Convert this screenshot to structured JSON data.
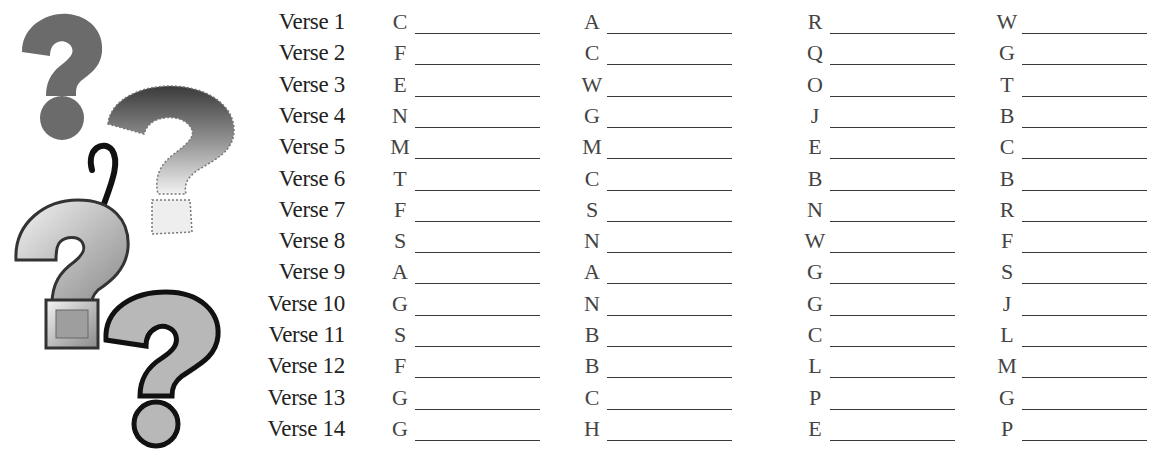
{
  "worksheet": {
    "decorations": [
      "question-mark-gray",
      "question-mark-fuzzy-gradient",
      "question-mark-script",
      "question-mark-beveled-3d",
      "question-mark-outlined"
    ],
    "columns": 4,
    "rows": [
      {
        "label": "Verse 1",
        "letters": [
          "C",
          "A",
          "R",
          "W"
        ]
      },
      {
        "label": "Verse 2",
        "letters": [
          "F",
          "C",
          "Q",
          "G"
        ]
      },
      {
        "label": "Verse 3",
        "letters": [
          "E",
          "W",
          "O",
          "T"
        ]
      },
      {
        "label": "Verse 4",
        "letters": [
          "N",
          "G",
          "J",
          "B"
        ]
      },
      {
        "label": "Verse 5",
        "letters": [
          "M",
          "M",
          "E",
          "C"
        ]
      },
      {
        "label": "Verse 6",
        "letters": [
          "T",
          "C",
          "B",
          "B"
        ]
      },
      {
        "label": "Verse 7",
        "letters": [
          "F",
          "S",
          "N",
          "R"
        ]
      },
      {
        "label": "Verse 8",
        "letters": [
          "S",
          "N",
          "W",
          "F"
        ]
      },
      {
        "label": "Verse 9",
        "letters": [
          "A",
          "A",
          "G",
          "S"
        ]
      },
      {
        "label": "Verse 10",
        "letters": [
          "G",
          "N",
          "G",
          "J"
        ]
      },
      {
        "label": "Verse 11",
        "letters": [
          "S",
          "B",
          "C",
          "L"
        ]
      },
      {
        "label": "Verse 12",
        "letters": [
          "F",
          "B",
          "L",
          "M"
        ]
      },
      {
        "label": "Verse 13",
        "letters": [
          "G",
          "C",
          "P",
          "G"
        ]
      },
      {
        "label": "Verse 14",
        "letters": [
          "G",
          "H",
          "E",
          "P"
        ]
      }
    ]
  }
}
